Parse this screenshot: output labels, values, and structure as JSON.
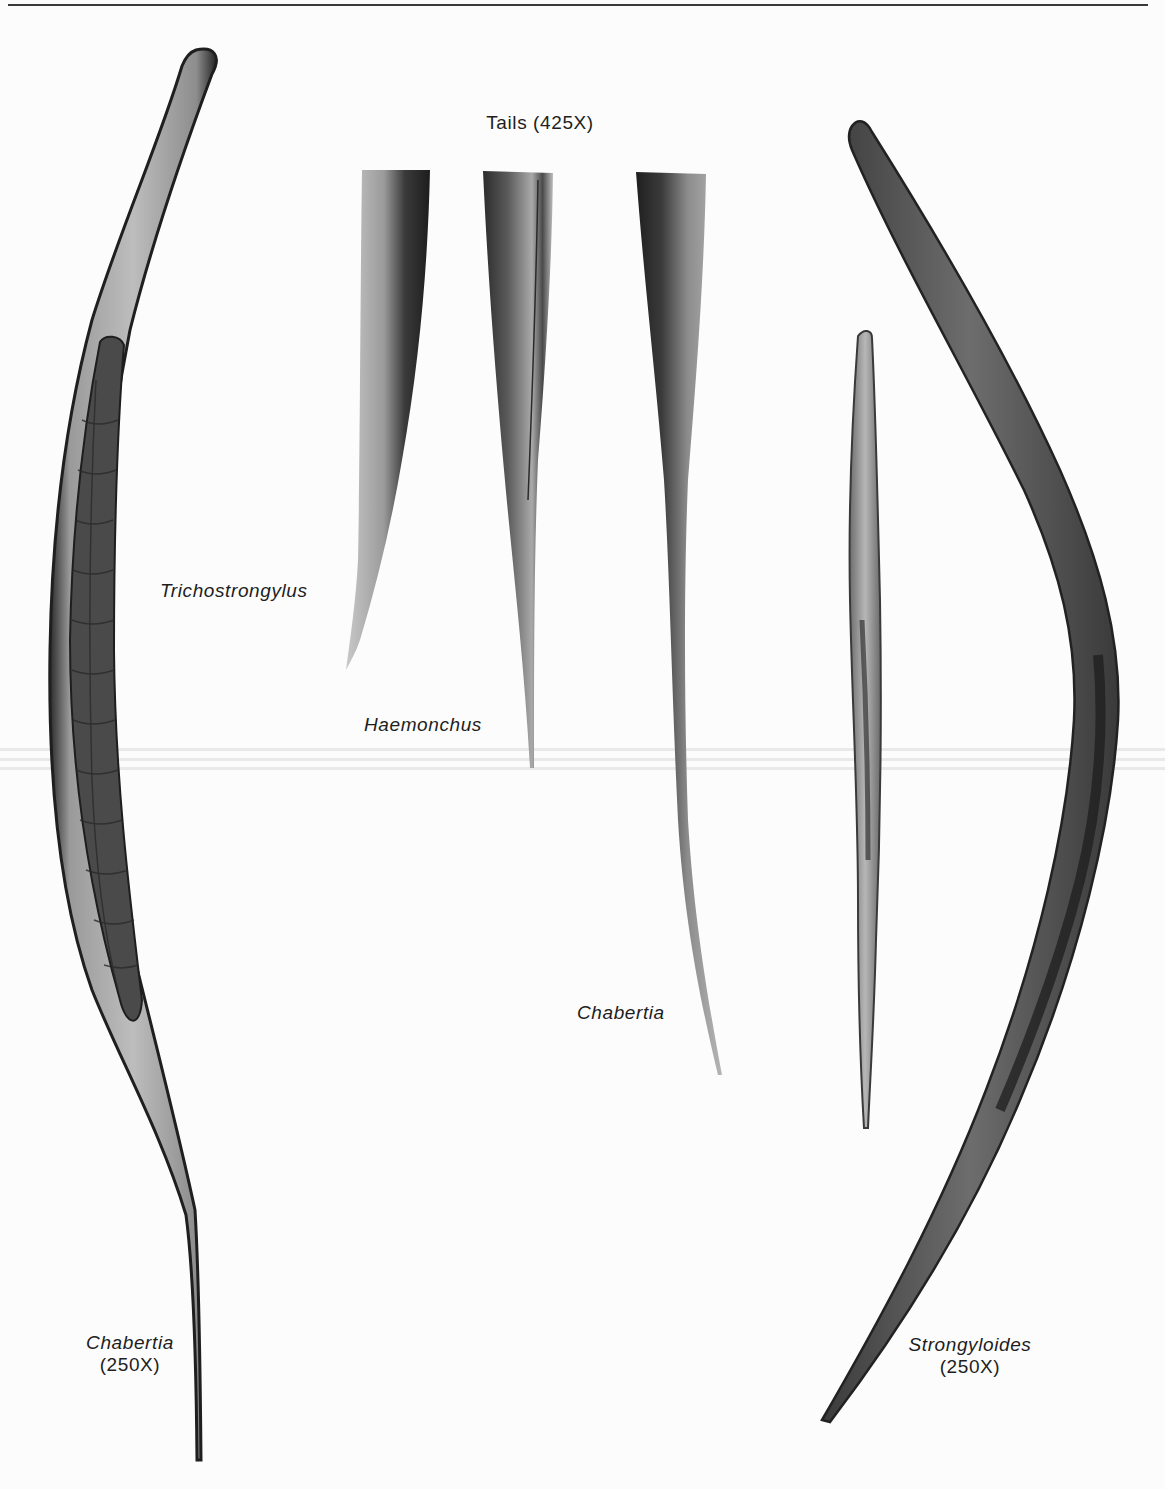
{
  "figure": {
    "heading": "Tails (425X)",
    "tail_panels": [
      {
        "species": "Trichostrongylus"
      },
      {
        "species": "Haemonchus"
      },
      {
        "species": "Chabertia"
      }
    ],
    "whole_specimens": [
      {
        "species": "Chabertia",
        "magnification": "(250X)"
      },
      {
        "species": "Strongyloides",
        "magnification": "(250X)"
      }
    ],
    "colors": {
      "background": "#fcfcfc",
      "ink": "#1e1e1e",
      "specimen_dark": "#2b2b2b",
      "specimen_mid": "#7a7a7a",
      "specimen_light": "#c9c9c9"
    }
  }
}
